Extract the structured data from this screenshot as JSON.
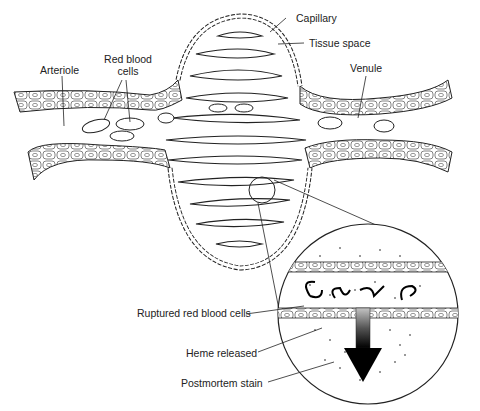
{
  "diagram": {
    "labels": {
      "capillary": "Capillary",
      "tissue_space": "Tissue space",
      "venule": "Venule",
      "arteriole": "Arteriole",
      "red_blood_cells_line1": "Red blood",
      "red_blood_cells_line2": "cells",
      "ruptured_rbc": "Ruptured red blood cells",
      "heme_released": "Heme released",
      "postmortem_stain": "Postmortem stain"
    },
    "colors": {
      "line": "#222222",
      "background": "#ffffff",
      "arrow_top": "#bbbbbb",
      "arrow_bottom": "#000000"
    }
  }
}
